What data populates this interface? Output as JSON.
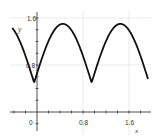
{
  "chart_data": {
    "type": "line",
    "title": "",
    "xlabel": "x",
    "ylabel": "y",
    "xlim": [
      -0.45,
      1.95
    ],
    "ylim": [
      -0.15,
      1.7
    ],
    "grid": true,
    "x_ticks": [
      0,
      0.8,
      1.6
    ],
    "x_tick_labels": [
      "0",
      "0.8",
      "1.6"
    ],
    "y_ticks": [
      0.8,
      1.6
    ],
    "y_tick_labels": [
      "0.8",
      "1.6"
    ],
    "minor_tick_step": 0.2,
    "series": [
      {
        "name": "y",
        "color": "#111111",
        "formula": "y = 0.5 + |sin(pi*(x+0.05))|",
        "x": [
          -0.43,
          -0.3,
          -0.15,
          -0.05,
          0.1,
          0.25,
          0.45,
          0.65,
          0.8,
          0.95,
          1.1,
          1.25,
          1.45,
          1.65,
          1.8,
          1.93
        ],
        "y": [
          1.45,
          1.29,
          0.81,
          0.5,
          0.95,
          1.31,
          1.5,
          1.31,
          0.95,
          0.5,
          0.95,
          1.31,
          1.5,
          1.31,
          0.95,
          0.6
        ]
      }
    ]
  },
  "axes": {
    "x_label": "x",
    "y_label": "y",
    "x_tick_labels": [
      "0",
      "0.8",
      "1.6"
    ],
    "y_tick_labels": [
      "0.8",
      "1.6"
    ]
  }
}
